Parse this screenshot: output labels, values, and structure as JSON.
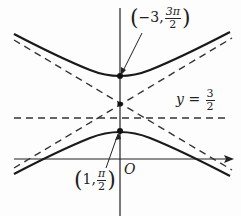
{
  "figure": {
    "type": "hyperbola graph with asymptotes",
    "colors": {
      "curve": "#1a1a1a",
      "dashed": "#333333",
      "axis": "#222222"
    },
    "labels": {
      "upper_vertex": {
        "prefix": "−3,",
        "num": "3π",
        "den": "2"
      },
      "lower_vertex": {
        "prefix": "1,",
        "num": "π",
        "den": "2"
      },
      "asymptote_line": {
        "var": "y",
        "eq": "=",
        "num": "3",
        "den": "2"
      },
      "origin": "O"
    },
    "points": [
      {
        "name": "upper-vertex",
        "label": "(-3, 3π/2)"
      },
      {
        "name": "lower-vertex",
        "label": "(1, π/2)"
      },
      {
        "name": "center",
        "label": ""
      }
    ],
    "lines": [
      {
        "name": "horizontal-dashed",
        "label": "y = 3/2"
      },
      {
        "name": "asymptote-1",
        "style": "dashed"
      },
      {
        "name": "asymptote-2",
        "style": "dashed"
      }
    ]
  }
}
